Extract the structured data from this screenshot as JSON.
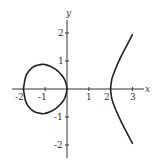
{
  "chart_data": {
    "type": "line",
    "title": "",
    "xlabel": "x",
    "ylabel": "y",
    "xlim": [
      -2.5,
      3.5
    ],
    "ylim": [
      -2.5,
      2.5
    ],
    "grid": false,
    "legend": null,
    "x_ticks": [
      "-2",
      "-1",
      "1",
      "2",
      "3"
    ],
    "y_ticks": [
      "2",
      "1",
      "-1",
      "-2"
    ],
    "series": [
      {
        "name": "oval",
        "x": [
          -2,
          -1.9,
          -1.75,
          -1.5,
          -1.155,
          -1,
          -0.75,
          -0.5,
          -0.25,
          -0.1,
          0
        ],
        "y_upper": [
          0,
          0.43,
          0.64,
          0.81,
          0.88,
          0.87,
          0.8,
          0.69,
          0.5,
          0.32,
          0
        ],
        "y_lower": [
          0,
          -0.43,
          -0.64,
          -0.81,
          -0.88,
          -0.87,
          -0.8,
          -0.69,
          -0.5,
          -0.32,
          0
        ]
      },
      {
        "name": "right-branch",
        "x": [
          2,
          2.05,
          2.1,
          2.25,
          2.5,
          2.75,
          3
        ],
        "y_upper": [
          0,
          0.32,
          0.46,
          0.77,
          1.19,
          1.57,
          1.94
        ],
        "y_lower": [
          0,
          -0.32,
          -0.46,
          -0.77,
          -1.19,
          -1.57,
          -1.94
        ]
      }
    ]
  },
  "labels": {
    "x_axis": "x",
    "y_axis": "y",
    "x_tick_labels": [
      "-2",
      "-1",
      "1",
      "2",
      "3"
    ],
    "y_tick_labels": [
      "2",
      "1",
      "-1",
      "-2"
    ]
  }
}
